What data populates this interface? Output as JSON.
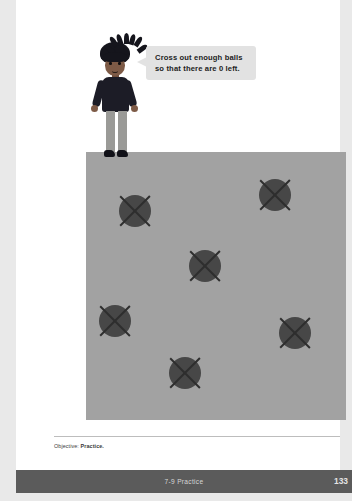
{
  "page": {
    "background_color": "#ffffff",
    "outer_background_color": "#e9e9e9"
  },
  "character": {
    "name": "student-character",
    "hair_color": "#15151c",
    "skin_color": "#7d5a46",
    "shirt_color": "#1c1c26",
    "pants_color": "#9a9a97",
    "shoe_color": "#111118"
  },
  "speech_bubble": {
    "text": "Cross out enough balls so that there are 0 left.",
    "line1": "Cross out enough balls",
    "line2": "so that there are 0 left.",
    "background_color": "#e2e2e2",
    "text_color": "#1d1d1d"
  },
  "activity": {
    "background_color": "#a2a2a2",
    "ball_color": "#474747",
    "cross_color": "#2e2e2e",
    "ball_count": 6,
    "crossed_out_count": 6,
    "remaining_count": 0,
    "balls": [
      {
        "id": "ball-1",
        "x": 28,
        "y": 38,
        "crossed": true
      },
      {
        "id": "ball-2",
        "x": 168,
        "y": 22,
        "crossed": true
      },
      {
        "id": "ball-3",
        "x": 98,
        "y": 93,
        "crossed": true
      },
      {
        "id": "ball-4",
        "x": 8,
        "y": 148,
        "crossed": true
      },
      {
        "id": "ball-5",
        "x": 188,
        "y": 160,
        "crossed": true
      },
      {
        "id": "ball-6",
        "x": 78,
        "y": 200,
        "crossed": true
      }
    ]
  },
  "objective": {
    "label": "Objective:",
    "value": "Practice."
  },
  "footer": {
    "title": "7-9 Practice",
    "page_number": "133",
    "background_color": "#5b5b5b",
    "text_color": "#d6d6d6"
  }
}
